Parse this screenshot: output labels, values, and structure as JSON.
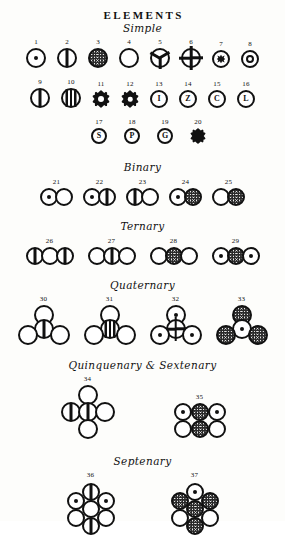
{
  "plate": {
    "title": "ELEMENTS"
  },
  "sections": [
    {
      "id": "simple",
      "label": "Simple"
    },
    {
      "id": "binary",
      "label": "Binary"
    },
    {
      "id": "ternary",
      "label": "Ternary"
    },
    {
      "id": "quaternary",
      "label": "Quaternary"
    },
    {
      "id": "quinquenary",
      "label": "Quinquenary & Sextenary"
    },
    {
      "id": "septenary",
      "label": "Septenary"
    }
  ],
  "simple": {
    "row1": [
      {
        "num": "1",
        "fill": "dot"
      },
      {
        "num": "2",
        "fill": "bar"
      },
      {
        "num": "3",
        "fill": "stipple"
      },
      {
        "num": "4",
        "fill": "open"
      },
      {
        "num": "5",
        "fill": "spokes-y"
      },
      {
        "num": "6",
        "fill": "spokes-x"
      },
      {
        "num": "7",
        "fill": "rosette"
      },
      {
        "num": "8",
        "fill": "ring"
      }
    ],
    "row2": [
      {
        "num": "9",
        "fill": "bar"
      },
      {
        "num": "10",
        "fill": "bars3"
      },
      {
        "num": "11",
        "fill": "clover"
      },
      {
        "num": "12",
        "fill": "clover"
      },
      {
        "num": "13",
        "fill": "letter",
        "letter": "I"
      },
      {
        "num": "14",
        "fill": "letter",
        "letter": "Z"
      },
      {
        "num": "15",
        "fill": "letter",
        "letter": "C"
      },
      {
        "num": "16",
        "fill": "letter",
        "letter": "L"
      }
    ],
    "row3": [
      {
        "num": "17",
        "fill": "letter",
        "letter": "S"
      },
      {
        "num": "18",
        "fill": "letter",
        "letter": "P"
      },
      {
        "num": "19",
        "fill": "letter",
        "letter": "G"
      },
      {
        "num": "20",
        "fill": "clover"
      }
    ]
  },
  "binary": [
    {
      "num": "21",
      "atoms": [
        "dot",
        "open"
      ]
    },
    {
      "num": "22",
      "atoms": [
        "dot",
        "bar"
      ]
    },
    {
      "num": "23",
      "atoms": [
        "bar",
        "open"
      ]
    },
    {
      "num": "24",
      "atoms": [
        "dot",
        "stipple"
      ]
    },
    {
      "num": "25",
      "atoms": [
        "open",
        "stipple"
      ]
    }
  ],
  "ternary": [
    {
      "num": "26",
      "atoms": [
        "bar",
        "open",
        "bar"
      ]
    },
    {
      "num": "27",
      "atoms": [
        "open",
        "bar",
        "open"
      ]
    },
    {
      "num": "28",
      "atoms": [
        "open",
        "stipple",
        "open"
      ]
    },
    {
      "num": "29",
      "atoms": [
        "dot",
        "stipple",
        "dot"
      ]
    }
  ],
  "quaternary": [
    {
      "num": "30",
      "top": "open",
      "mid": "bar",
      "bl": "open",
      "br": "open"
    },
    {
      "num": "31",
      "top": "open",
      "mid": "bars3",
      "bl": "open",
      "br": "open"
    },
    {
      "num": "32",
      "top": "dot",
      "mid": "spokes-x",
      "bl": "dot",
      "br": "dot"
    },
    {
      "num": "33",
      "top": "stipple",
      "mid": "dot",
      "bl": "stipple",
      "br": "stipple"
    }
  ],
  "quinquenary": [
    {
      "num": "34",
      "type": "plus",
      "top": "open",
      "mid": "bar",
      "left": "bar",
      "right": "open",
      "bottom": "open"
    },
    {
      "num": "35",
      "type": "grid6",
      "tl": "dot",
      "tm": "stipple",
      "tr": "dot",
      "bl": "open",
      "bm": "stipple",
      "br": "open"
    }
  ],
  "septenary": [
    {
      "num": "36",
      "c": "open",
      "t": "bar",
      "b": "bar",
      "ul": "dot",
      "ur": "dot",
      "ll": "open",
      "lr": "open"
    },
    {
      "num": "37",
      "c": "stipple",
      "t": "dot",
      "b": "stipple",
      "ul": "stipple",
      "ur": "stipple",
      "ll": "open",
      "lr": "open"
    }
  ]
}
